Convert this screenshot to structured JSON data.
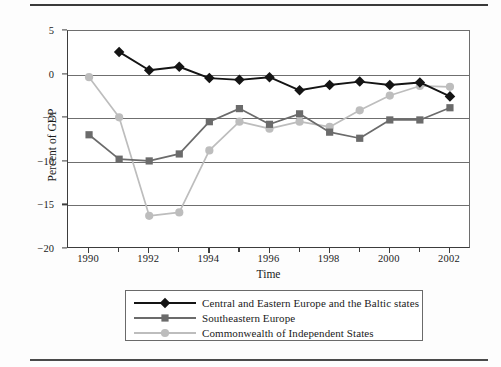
{
  "figure": {
    "ylabel": "Percent of GDP",
    "xlabel": "Time"
  },
  "axes": {
    "ytick_labels": [
      "5",
      "0",
      "−5",
      "−10",
      "−15",
      "−20"
    ],
    "ytick_values": [
      5,
      0,
      -5,
      -10,
      -15,
      -20
    ],
    "xtick_labels": [
      "1990",
      "1992",
      "1994",
      "1996",
      "1998",
      "2000",
      "2002"
    ],
    "xtick_values": [
      1990,
      1992,
      1994,
      1996,
      1998,
      2000,
      2002
    ],
    "xminor_values": [
      1991,
      1993,
      1995,
      1997,
      1999,
      2001
    ]
  },
  "legend": {
    "items": [
      {
        "label": "Central and Eastern Europe and the Baltic states",
        "color": "#141414",
        "marker": "diamond"
      },
      {
        "label": "Southeastern Europe",
        "color": "#6b6b6b",
        "marker": "square"
      },
      {
        "label": "Commonwealth of Independent States",
        "color": "#bdbdbd",
        "marker": "circle"
      }
    ]
  },
  "chart_data": {
    "type": "line",
    "title": "",
    "xlabel": "Time",
    "ylabel": "Percent of GDP",
    "xlim": [
      1989.3,
      2002.7
    ],
    "ylim": [
      -20,
      5
    ],
    "grid": true,
    "legend_position": "below",
    "x": [
      1990,
      1991,
      1992,
      1993,
      1994,
      1995,
      1996,
      1997,
      1998,
      1999,
      2000,
      2001,
      2002
    ],
    "series": [
      {
        "name": "Central and Eastern Europe and the Baltic states",
        "color": "#141414",
        "marker": "diamond",
        "x": [
          1991,
          1992,
          1993,
          1994,
          1995,
          1996,
          1997,
          1998,
          1999,
          2000,
          2001,
          2002
        ],
        "values": [
          2.6,
          0.5,
          0.9,
          -0.4,
          -0.6,
          -0.3,
          -1.8,
          -1.2,
          -0.8,
          -1.2,
          -0.9,
          -2.5
        ]
      },
      {
        "name": "Southeastern Europe",
        "color": "#6b6b6b",
        "marker": "square",
        "x": [
          1990,
          1991,
          1992,
          1993,
          1994,
          1995,
          1996,
          1997,
          1998,
          1999,
          2000,
          2001,
          2002
        ],
        "values": [
          -6.9,
          -9.7,
          -9.9,
          -9.1,
          -5.4,
          -3.9,
          -5.7,
          -4.5,
          -6.6,
          -7.3,
          -5.2,
          -5.2,
          -3.8
        ]
      },
      {
        "name": "Commonwealth of Independent States",
        "color": "#bdbdbd",
        "marker": "circle",
        "x": [
          1990,
          1991,
          1992,
          1993,
          1994,
          1995,
          1996,
          1997,
          1998,
          1999,
          2000,
          2001,
          2002
        ],
        "values": [
          -0.3,
          -4.9,
          -16.2,
          -15.8,
          -8.7,
          -5.4,
          -6.2,
          -5.4,
          -6.0,
          -4.1,
          -2.4,
          -1.3,
          -1.4
        ]
      }
    ]
  }
}
